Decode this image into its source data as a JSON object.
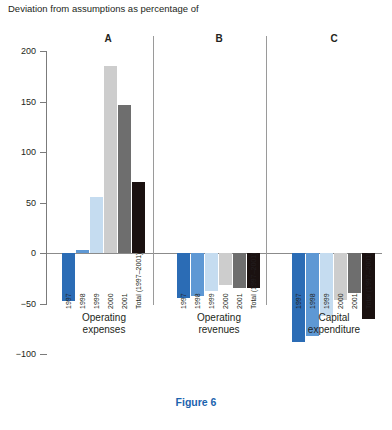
{
  "title": "Deviation from assumptions as percentage of",
  "caption": "Figure 6",
  "axis": {
    "y_ticks": [
      "200",
      "150",
      "100",
      "50",
      "0",
      "-50",
      "-100"
    ],
    "y_min": -100,
    "y_max": 200
  },
  "series_labels": [
    "1997",
    "1998",
    "1999",
    "2000",
    "2001",
    "Total (1997–2001)"
  ],
  "colors": {
    "s1997": "#2b6cb5",
    "s1998": "#5e98d4",
    "s1999": "#c5dcf0",
    "s2000": "#cdcdcd",
    "s2001": "#6e6e6e",
    "total": "#1a1110",
    "accent": "#1b63ae",
    "axis": "#7b7b7b"
  },
  "groups": [
    {
      "letter": "A",
      "name_line1": "Operating",
      "name_line2": "expenses",
      "values": [
        -48,
        3,
        55,
        185,
        147,
        70
      ]
    },
    {
      "letter": "B",
      "name_line1": "Operating",
      "name_line2": "revenues",
      "values": [
        -45,
        -43,
        -38,
        -32,
        -35,
        -35
      ]
    },
    {
      "letter": "C",
      "name_line1": "Capital",
      "name_line2": "expenditure",
      "values": [
        -88,
        -82,
        -62,
        -47,
        -40,
        -65
      ]
    }
  ],
  "chart_data": {
    "type": "bar",
    "title": "Deviation from assumptions as percentage of",
    "subtitle": "Figure 6",
    "xlabel": "",
    "ylabel": "Deviation from assumptions as percentage of",
    "ylim": [
      -100,
      200
    ],
    "yticks": [
      -100,
      -50,
      0,
      50,
      100,
      150,
      200
    ],
    "grid": false,
    "legend": "none",
    "categories": [
      "1997",
      "1998",
      "1999",
      "2000",
      "2001",
      "Total (1997–2001)"
    ],
    "panels": [
      {
        "letter": "A",
        "label": "Operating expenses",
        "values": [
          -48,
          3,
          55,
          185,
          147,
          70
        ]
      },
      {
        "letter": "B",
        "label": "Operating revenues",
        "values": [
          -45,
          -43,
          -38,
          -32,
          -35,
          -35
        ]
      },
      {
        "letter": "C",
        "label": "Capital expenditure",
        "values": [
          -88,
          -82,
          -62,
          -47,
          -40,
          -65
        ]
      }
    ]
  }
}
